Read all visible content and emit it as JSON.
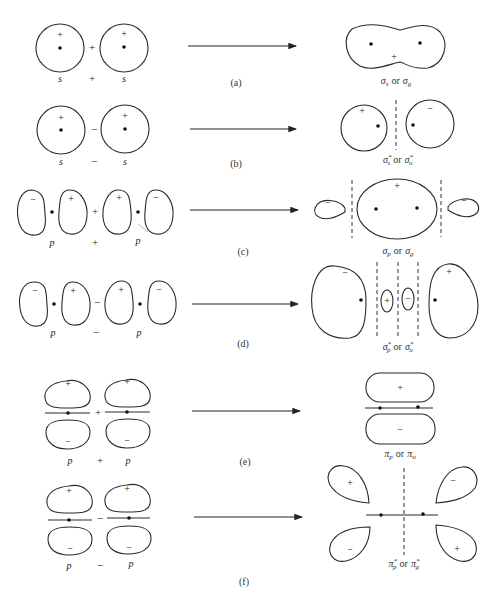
{
  "figure": {
    "rows": [
      {
        "tag": "(a)",
        "left": {
          "orbital": "s",
          "sign_top": "+"
        },
        "operator": "+",
        "right": {
          "orbital": "s",
          "sign_top": "+"
        },
        "bottom_operator": "+",
        "result_label": "σs or σg",
        "result_signs": [
          "+"
        ]
      },
      {
        "tag": "(b)",
        "left": {
          "orbital": "s",
          "sign_top": "+"
        },
        "operator": "−",
        "right": {
          "orbital": "s",
          "sign_top": "+"
        },
        "bottom_operator": "−",
        "result_label": "σs* or σu*",
        "result_signs": [
          "+",
          "−"
        ]
      },
      {
        "tag": "(c)",
        "left": {
          "orbital": "p",
          "lobes": [
            "−",
            "+"
          ]
        },
        "operator": "+",
        "right": {
          "orbital": "p",
          "lobes": [
            "+",
            "−"
          ]
        },
        "bottom_operator": "+",
        "result_label": "σp or σg",
        "result_signs": [
          "−",
          "+",
          "−"
        ]
      },
      {
        "tag": "(d)",
        "left": {
          "orbital": "p",
          "lobes": [
            "−",
            "+"
          ]
        },
        "operator": "−",
        "right": {
          "orbital": "p",
          "lobes": [
            "+",
            "−"
          ]
        },
        "bottom_operator": "−",
        "result_label": "σp* or σu*",
        "result_signs": [
          "−",
          "+",
          "−",
          "+"
        ]
      },
      {
        "tag": "(e)",
        "left": {
          "orbital": "p",
          "lobes": [
            "+",
            "−"
          ]
        },
        "operator": "+",
        "right": {
          "orbital": "p",
          "lobes": [
            "+",
            "−"
          ]
        },
        "bottom_operator": "+",
        "result_label": "πp or πu",
        "result_signs": [
          "+",
          "−"
        ]
      },
      {
        "tag": "(f)",
        "left": {
          "orbital": "p",
          "lobes": [
            "+",
            "−"
          ]
        },
        "operator": "−",
        "right": {
          "orbital": "p",
          "lobes": [
            "+",
            "−"
          ]
        },
        "bottom_operator": "−",
        "result_label": "πp* or πg*",
        "result_signs": [
          "+",
          "−",
          "−",
          "+"
        ]
      }
    ]
  },
  "labels": {
    "a_main": "σ",
    "a_sub1": "s",
    "a_or": "or",
    "a_main2": "σ",
    "a_sub2": "g",
    "b_main": "σ",
    "b_sup1": "*",
    "b_sub1": "s",
    "b_or": "or",
    "b_main2": "σ",
    "b_sup2": "*",
    "b_sub2": "u",
    "c_main": "σ",
    "c_sub1": "p",
    "c_or": "or",
    "c_main2": "σ",
    "c_sub2": "g",
    "d_main": "σ",
    "d_sup1": "*",
    "d_sub1": "p",
    "d_or": "or",
    "d_main2": "σ",
    "d_sup2": "*",
    "d_sub2": "u",
    "e_main": "π",
    "e_sub1": "p",
    "e_or": "or",
    "e_main2": "π",
    "e_sub2": "u",
    "f_main": "π",
    "f_sup1": "*",
    "f_sub1": "p",
    "f_or": "or",
    "f_main2": "π",
    "f_sup2": "*",
    "f_sub2": "g"
  }
}
